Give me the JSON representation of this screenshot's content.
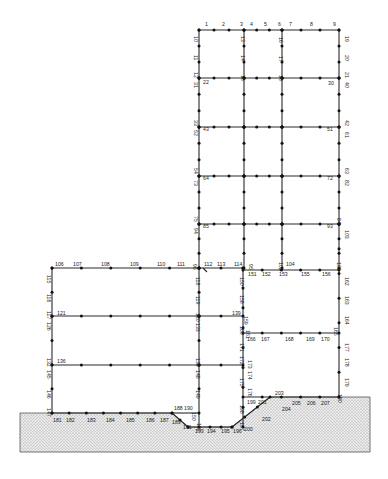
{
  "colors": {
    "line": "#2a2a2a",
    "node": "#111111",
    "ground_fill": "#e6e6e6",
    "ground_dots": "#8a8a8a"
  },
  "structure": {
    "tower": {
      "x": [
        199,
        244,
        282,
        339
      ],
      "y": [
        30,
        78,
        127,
        176,
        224,
        268
      ]
    },
    "left_wing": {
      "x": [
        52,
        199
      ],
      "y": [
        268,
        316,
        365,
        413
      ]
    },
    "middle_block": {
      "x": [
        243,
        339
      ],
      "y": [
        270,
        333,
        397
      ]
    },
    "ground_profile": [
      [
        20,
        413
      ],
      [
        172,
        413
      ],
      [
        188,
        427
      ],
      [
        232,
        427
      ],
      [
        270,
        397
      ],
      [
        339,
        397
      ],
      [
        370,
        397
      ]
    ]
  },
  "labels": [
    {
      "t": "1",
      "x": 205,
      "y": 26
    },
    {
      "t": "2",
      "x": 222,
      "y": 26
    },
    {
      "t": "3",
      "x": 240,
      "y": 26
    },
    {
      "t": "4",
      "x": 250,
      "y": 26
    },
    {
      "t": "5",
      "x": 264,
      "y": 26
    },
    {
      "t": "6",
      "x": 278,
      "y": 26
    },
    {
      "t": "7",
      "x": 289,
      "y": 26
    },
    {
      "t": "8",
      "x": 310,
      "y": 26
    },
    {
      "t": "9",
      "x": 333,
      "y": 26
    },
    {
      "t": "10",
      "x": 194,
      "y": 36,
      "r": 1
    },
    {
      "t": "11",
      "x": 194,
      "y": 55,
      "r": 1
    },
    {
      "t": "12",
      "x": 194,
      "y": 72,
      "r": 1
    },
    {
      "t": "13",
      "x": 241,
      "y": 36,
      "r": 1
    },
    {
      "t": "14",
      "x": 241,
      "y": 55,
      "r": 1
    },
    {
      "t": "15",
      "x": 241,
      "y": 75,
      "r": 1
    },
    {
      "t": "16",
      "x": 279,
      "y": 37,
      "r": 1
    },
    {
      "t": "17",
      "x": 279,
      "y": 56,
      "r": 1
    },
    {
      "t": "18",
      "x": 279,
      "y": 75,
      "r": 1
    },
    {
      "t": "19",
      "x": 345,
      "y": 36,
      "r": 1
    },
    {
      "t": "20",
      "x": 345,
      "y": 55,
      "r": 1
    },
    {
      "t": "21",
      "x": 345,
      "y": 72,
      "r": 1
    },
    {
      "t": "22",
      "x": 203,
      "y": 84
    },
    {
      "t": "30",
      "x": 328,
      "y": 85
    },
    {
      "t": "31",
      "x": 194,
      "y": 82,
      "r": 1
    },
    {
      "t": "40",
      "x": 345,
      "y": 82,
      "r": 1
    },
    {
      "t": "33",
      "x": 194,
      "y": 120,
      "r": 1
    },
    {
      "t": "43",
      "x": 203,
      "y": 131
    },
    {
      "t": "51",
      "x": 327,
      "y": 131
    },
    {
      "t": "52",
      "x": 194,
      "y": 130,
      "r": 1
    },
    {
      "t": "42",
      "x": 345,
      "y": 120,
      "r": 1
    },
    {
      "t": "61",
      "x": 345,
      "y": 132,
      "r": 1
    },
    {
      "t": "54",
      "x": 194,
      "y": 168,
      "r": 1
    },
    {
      "t": "64",
      "x": 203,
      "y": 180
    },
    {
      "t": "72",
      "x": 327,
      "y": 180
    },
    {
      "t": "73",
      "x": 194,
      "y": 180,
      "r": 1
    },
    {
      "t": "63",
      "x": 345,
      "y": 168,
      "r": 1
    },
    {
      "t": "82",
      "x": 345,
      "y": 180,
      "r": 1
    },
    {
      "t": "75",
      "x": 194,
      "y": 216,
      "r": 1
    },
    {
      "t": "85",
      "x": 203,
      "y": 228
    },
    {
      "t": "93",
      "x": 327,
      "y": 228
    },
    {
      "t": "94",
      "x": 194,
      "y": 228,
      "r": 1
    },
    {
      "t": "84",
      "x": 337,
      "y": 218,
      "r": 1
    },
    {
      "t": "103",
      "x": 345,
      "y": 230,
      "r": 1
    },
    {
      "t": "106",
      "x": 55,
      "y": 266
    },
    {
      "t": "107",
      "x": 73,
      "y": 266
    },
    {
      "t": "108",
      "x": 101,
      "y": 266
    },
    {
      "t": "109",
      "x": 130,
      "y": 266
    },
    {
      "t": "110",
      "x": 157,
      "y": 266
    },
    {
      "t": "111",
      "x": 177,
      "y": 266
    },
    {
      "t": "96",
      "x": 193,
      "y": 264,
      "r": 1
    },
    {
      "t": "112",
      "x": 204,
      "y": 266
    },
    {
      "t": "113",
      "x": 217,
      "y": 266
    },
    {
      "t": "114",
      "x": 234,
      "y": 266
    },
    {
      "t": "95",
      "x": 249,
      "y": 264,
      "r": 1
    },
    {
      "t": "102",
      "x": 279,
      "y": 262,
      "r": 1
    },
    {
      "t": "104",
      "x": 286,
      "y": 266
    },
    {
      "t": "105",
      "x": 337,
      "y": 262,
      "r": 1
    },
    {
      "t": "115",
      "x": 47,
      "y": 275,
      "r": 1
    },
    {
      "t": "116",
      "x": 47,
      "y": 294,
      "r": 1
    },
    {
      "t": "117",
      "x": 47,
      "y": 311,
      "r": 1
    },
    {
      "t": "118",
      "x": 196,
      "y": 277,
      "r": 1
    },
    {
      "t": "119",
      "x": 196,
      "y": 296,
      "r": 1
    },
    {
      "t": "120",
      "x": 196,
      "y": 313,
      "r": 1
    },
    {
      "t": "121",
      "x": 57,
      "y": 315
    },
    {
      "t": "126",
      "x": 47,
      "y": 322,
      "r": 1
    },
    {
      "t": "133",
      "x": 196,
      "y": 323,
      "r": 1
    },
    {
      "t": "150",
      "x": 240,
      "y": 277,
      "r": 1
    },
    {
      "t": "151",
      "x": 248,
      "y": 276
    },
    {
      "t": "152",
      "x": 262,
      "y": 276
    },
    {
      "t": "153",
      "x": 279,
      "y": 276
    },
    {
      "t": "155",
      "x": 301,
      "y": 276
    },
    {
      "t": "156",
      "x": 322,
      "y": 276
    },
    {
      "t": "162",
      "x": 345,
      "y": 277,
      "r": 1
    },
    {
      "t": "158",
      "x": 240,
      "y": 295,
      "r": 1
    },
    {
      "t": "163",
      "x": 345,
      "y": 296,
      "r": 1
    },
    {
      "t": "159",
      "x": 244,
      "y": 316,
      "r": 1
    },
    {
      "t": "139",
      "x": 232,
      "y": 315
    },
    {
      "t": "160",
      "x": 240,
      "y": 326,
      "r": 1
    },
    {
      "t": "164",
      "x": 345,
      "y": 316,
      "r": 1
    },
    {
      "t": "161",
      "x": 246,
      "y": 330,
      "r": 1
    },
    {
      "t": "165",
      "x": 334,
      "y": 327,
      "r": 1
    },
    {
      "t": "171",
      "x": 240,
      "y": 343,
      "r": 1
    },
    {
      "t": "166",
      "x": 247,
      "y": 341
    },
    {
      "t": "167",
      "x": 261,
      "y": 341
    },
    {
      "t": "168",
      "x": 285,
      "y": 341
    },
    {
      "t": "169",
      "x": 306,
      "y": 341
    },
    {
      "t": "170",
      "x": 321,
      "y": 341
    },
    {
      "t": "177",
      "x": 345,
      "y": 343,
      "r": 1
    },
    {
      "t": "132",
      "x": 47,
      "y": 358,
      "r": 1
    },
    {
      "t": "136",
      "x": 57,
      "y": 363
    },
    {
      "t": "145",
      "x": 47,
      "y": 370,
      "r": 1
    },
    {
      "t": "135",
      "x": 196,
      "y": 358,
      "r": 1
    },
    {
      "t": "148",
      "x": 196,
      "y": 370,
      "r": 1
    },
    {
      "t": "172",
      "x": 240,
      "y": 356,
      "r": 1
    },
    {
      "t": "173",
      "x": 248,
      "y": 360,
      "r": 1
    },
    {
      "t": "174",
      "x": 248,
      "y": 371,
      "r": 1
    },
    {
      "t": "175",
      "x": 240,
      "y": 378,
      "r": 1
    },
    {
      "t": "178",
      "x": 345,
      "y": 358,
      "r": 1
    },
    {
      "t": "179",
      "x": 345,
      "y": 378,
      "r": 1
    },
    {
      "t": "146",
      "x": 47,
      "y": 390,
      "r": 1
    },
    {
      "t": "149",
      "x": 196,
      "y": 390,
      "r": 1
    },
    {
      "t": "147",
      "x": 47,
      "y": 408,
      "r": 1
    },
    {
      "t": "176",
      "x": 248,
      "y": 388,
      "r": 1
    },
    {
      "t": "203",
      "x": 275,
      "y": 395
    },
    {
      "t": "180",
      "x": 338,
      "y": 394,
      "r": 1
    },
    {
      "t": "198",
      "x": 240,
      "y": 405,
      "r": 1
    },
    {
      "t": "199",
      "x": 247,
      "y": 404
    },
    {
      "t": "201",
      "x": 258,
      "y": 404
    },
    {
      "t": "205",
      "x": 292,
      "y": 405
    },
    {
      "t": "206",
      "x": 307,
      "y": 405
    },
    {
      "t": "207",
      "x": 321,
      "y": 405
    },
    {
      "t": "188",
      "x": 174,
      "y": 410
    },
    {
      "t": "190",
      "x": 184,
      "y": 410
    },
    {
      "t": "150",
      "x": 192,
      "y": 412,
      "r": 1
    },
    {
      "t": "181",
      "x": 53,
      "y": 422
    },
    {
      "t": "182",
      "x": 66,
      "y": 422
    },
    {
      "t": "183",
      "x": 87,
      "y": 422
    },
    {
      "t": "184",
      "x": 106,
      "y": 422
    },
    {
      "t": "185",
      "x": 126,
      "y": 422
    },
    {
      "t": "186",
      "x": 146,
      "y": 422
    },
    {
      "t": "187",
      "x": 160,
      "y": 422
    },
    {
      "t": "189",
      "x": 172,
      "y": 424
    },
    {
      "t": "192",
      "x": 197,
      "y": 423,
      "r": 1
    },
    {
      "t": "191",
      "x": 183,
      "y": 429
    },
    {
      "t": "193",
      "x": 195,
      "y": 433
    },
    {
      "t": "194",
      "x": 207,
      "y": 433
    },
    {
      "t": "195",
      "x": 221,
      "y": 433
    },
    {
      "t": "196",
      "x": 233,
      "y": 433
    },
    {
      "t": "197",
      "x": 240,
      "y": 422,
      "r": 1
    },
    {
      "t": "200",
      "x": 244,
      "y": 431
    },
    {
      "t": "202",
      "x": 262,
      "y": 421
    },
    {
      "t": "204",
      "x": 282,
      "y": 411
    }
  ]
}
